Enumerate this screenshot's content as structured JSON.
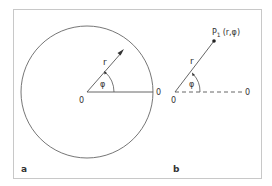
{
  "figure": {
    "panel_a": {
      "label": "a",
      "origin_label": "0",
      "axis_end_label": "0",
      "radius_label": "r",
      "angle_label": "φ"
    },
    "panel_b": {
      "label": "b",
      "origin_label": "0",
      "axis_end_label": "0",
      "radius_label": "r",
      "angle_label": "φ",
      "point_label": "P",
      "point_subscript": "1",
      "point_coords": "(r,φ)"
    },
    "colors": {
      "frame": "#c8c8c8",
      "stroke": "#555555",
      "text": "#333333"
    }
  }
}
